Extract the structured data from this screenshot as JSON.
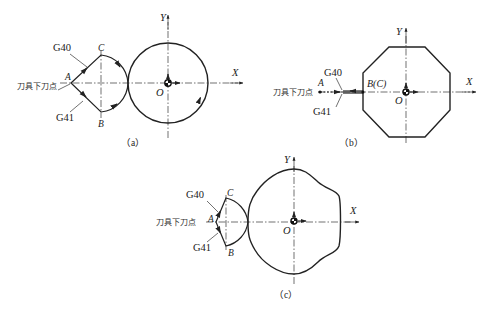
{
  "figure": {
    "panels": [
      {
        "id": "a",
        "caption": "（a）",
        "contour": "circle",
        "axis_x_label": "X",
        "axis_y_label": "Y",
        "origin_label": "O",
        "point_labels": {
          "A": "A",
          "B": "B",
          "C": "C"
        },
        "g40_label": "G40",
        "g41_label": "G41",
        "tool_down_label": "刀具下刀点"
      },
      {
        "id": "b",
        "caption": "（b）",
        "contour": "octagon",
        "axis_x_label": "X",
        "axis_y_label": "Y",
        "origin_label": "O",
        "point_labels": {
          "A": "A",
          "BC": "B(C)"
        },
        "g40_label": "G40",
        "g41_label": "G41",
        "tool_down_label": "刀具下刀点"
      },
      {
        "id": "c",
        "caption": "（c）",
        "contour": "irregular curve",
        "axis_x_label": "X",
        "axis_y_label": "Y",
        "origin_label": "O",
        "point_labels": {
          "A": "A",
          "B": "B",
          "C": "C"
        },
        "g40_label": "G40",
        "g41_label": "G41",
        "tool_down_label": "刀具下刀点"
      }
    ]
  }
}
